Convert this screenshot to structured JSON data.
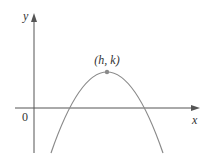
{
  "diagram": {
    "axes": {
      "x_label": "x",
      "y_label": "y",
      "origin_label": "0"
    },
    "vertex": {
      "label": "(h, k)"
    },
    "colors": {
      "axis": "#555555",
      "curve": "#8a8a8a",
      "vertex_point": "#8a8a8a",
      "text": "#333333"
    }
  }
}
